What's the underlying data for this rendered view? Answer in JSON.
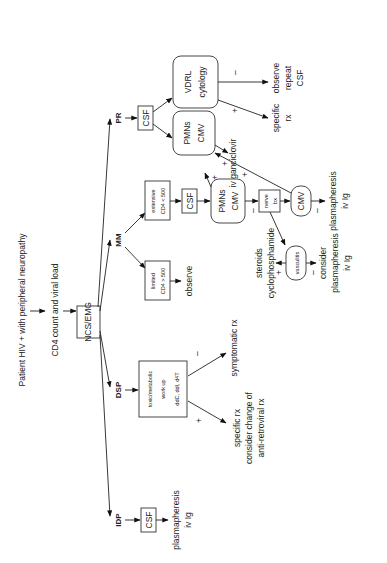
{
  "diagram": {
    "title": "Patient HIV + with peripheral neuropathy",
    "step2": "CD4 count and viral load",
    "root": "NCS/EMG",
    "branches": {
      "pr": "PR",
      "mm": "MM",
      "dsp": "DSP",
      "idp": "IDP"
    },
    "pr": {
      "csf": "CSF",
      "pmns_cmv": [
        "PMNs",
        "CMV"
      ],
      "vdrl": [
        "VDRL",
        "cytology"
      ],
      "vdrl_neg": [
        "observe",
        "repeat",
        "CSF"
      ],
      "vdrl_pos": [
        "specific",
        "rx"
      ],
      "ganciclovir": "iv ganciclovir"
    },
    "mm": {
      "extensive": [
        "extensive",
        "CD4 < 500"
      ],
      "limited": [
        "limited",
        "CD4 > 500"
      ],
      "observe": "observe",
      "csf": "CSF",
      "pmns_cmv": [
        "PMNs",
        "CMV"
      ],
      "nerve_bx": [
        "nerve",
        "bx"
      ],
      "cmv": "CMV",
      "vasculitis": "vasculitis",
      "vasculitis_pos": [
        "steroids",
        "cyclophosphamide"
      ],
      "vasculitis_neg": [
        "consider",
        "plasmapheresis",
        "iv Ig"
      ],
      "cmv_neg": [
        "plasmapheresis",
        "iv Ig"
      ]
    },
    "dsp": {
      "box": [
        "toxic/metabolic",
        "work up",
        "ddC, ddI, d4T"
      ],
      "neg": "symptomatic rx",
      "pos": [
        "specific rx",
        "consider change of",
        "anti-retroviral rx"
      ]
    },
    "idp": {
      "csf": "CSF",
      "result": [
        "plasmapheresis",
        "iv Ig"
      ]
    },
    "signs": {
      "plus": "+",
      "minus": "–"
    }
  }
}
